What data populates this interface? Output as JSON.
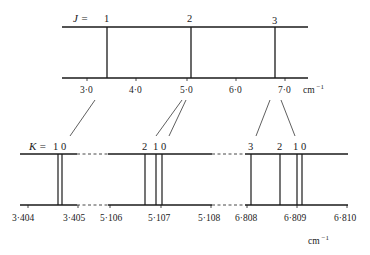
{
  "top_diagram": {
    "axis_label": "J =",
    "levels": [
      {
        "label": "1",
        "x": 107
      },
      {
        "label": "2",
        "x": 191
      },
      {
        "label": "3",
        "x": 275
      }
    ],
    "ticks": [
      {
        "label": "3·0",
        "x": 87
      },
      {
        "label": "4·0",
        "x": 136
      },
      {
        "label": "5·0",
        "x": 187
      },
      {
        "label": "6·0",
        "x": 236
      },
      {
        "label": "7·0",
        "x": 285
      }
    ],
    "unit": "cm",
    "unit_exp": "−1"
  },
  "bottom_diagram": {
    "axis_label": "K =",
    "groups": [
      {
        "labels": "1 0",
        "lines": [
          58,
          62
        ]
      },
      {
        "labels": "2 1 0",
        "lines": [
          145,
          156,
          162
        ]
      },
      {
        "labels": "3       2  1 0",
        "lines": [
          251,
          280,
          297,
          302
        ]
      }
    ],
    "group_labels": {
      "g1": "1 0",
      "g2_k2": "2",
      "g2_k10": "1 0",
      "g3_k3": "3",
      "g3_k2": "2",
      "g3_k10": "1 0"
    },
    "ticks": [
      {
        "label": "3·404",
        "x": 28
      },
      {
        "label": "3·405",
        "x": 78
      },
      {
        "label": "5·106",
        "x": 110
      },
      {
        "label": "5·107",
        "x": 161
      },
      {
        "label": "5·108",
        "x": 211
      },
      {
        "label": "6·808",
        "x": 247
      },
      {
        "label": "6·809",
        "x": 297
      },
      {
        "label": "6·810",
        "x": 347
      }
    ],
    "unit": "cm",
    "unit_exp": "−1"
  },
  "colors": {
    "ink": "#1a1a1a",
    "background": "#ffffff"
  }
}
